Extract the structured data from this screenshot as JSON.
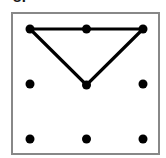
{
  "label": {
    "text": "8."
  },
  "frame": {
    "x": 11,
    "y": 12,
    "width": 149,
    "height": 143,
    "border_color": "#888888",
    "fill_color": "#ffffff",
    "border_width": 2
  },
  "style": {
    "dot_color": "#000000",
    "dot_radius": 4.5,
    "line_color": "#000000",
    "line_width": 3.2,
    "background": "#ffffff"
  },
  "figure": {
    "type": "dot-grid-with-polygon",
    "grid": {
      "rows": 3,
      "cols": 3,
      "origin_x": 30,
      "origin_y": 29,
      "spacing_x": 56.5,
      "spacing_y": 55
    },
    "dots": [
      {
        "id": "d0",
        "row": 0,
        "col": 0,
        "x": 30,
        "y": 29
      },
      {
        "id": "d1",
        "row": 0,
        "col": 1,
        "x": 86.5,
        "y": 29
      },
      {
        "id": "d2",
        "row": 0,
        "col": 2,
        "x": 143,
        "y": 29
      },
      {
        "id": "d3",
        "row": 1,
        "col": 0,
        "x": 30,
        "y": 84
      },
      {
        "id": "d4",
        "row": 1,
        "col": 1,
        "x": 86.5,
        "y": 85
      },
      {
        "id": "d5",
        "row": 1,
        "col": 2,
        "x": 143,
        "y": 84
      },
      {
        "id": "d6",
        "row": 2,
        "col": 0,
        "x": 30,
        "y": 139
      },
      {
        "id": "d7",
        "row": 2,
        "col": 1,
        "x": 86.5,
        "y": 139
      },
      {
        "id": "d8",
        "row": 2,
        "col": 2,
        "x": 143,
        "y": 139
      }
    ],
    "polygon": {
      "name": "inverted-triangle",
      "closed": true,
      "vertex_ids": [
        "d0",
        "d2",
        "d4"
      ],
      "points": "30,29 143,29 86.5,85",
      "passes_through_ids": [
        "d1"
      ]
    }
  }
}
